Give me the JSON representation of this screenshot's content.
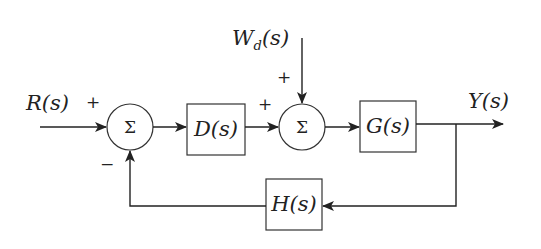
{
  "diagram": {
    "type": "feedback-control-block-diagram",
    "input": {
      "label": "R(s)",
      "sign": "+"
    },
    "disturbance": {
      "label": "W_d(s)",
      "label_main": "W",
      "label_sub": "d",
      "label_tail": "(s)",
      "sign": "+"
    },
    "output": {
      "label": "Y(s)"
    },
    "summing_junctions": [
      {
        "id": "sum1",
        "symbol": "Σ",
        "inputs": [
          {
            "from": "R(s)",
            "sign": "+"
          },
          {
            "from": "H(s)",
            "sign": "−"
          }
        ]
      },
      {
        "id": "sum2",
        "symbol": "Σ",
        "inputs": [
          {
            "from": "D(s)",
            "sign": "+"
          },
          {
            "from": "W_d(s)",
            "sign": "+"
          }
        ]
      }
    ],
    "blocks": [
      {
        "id": "D",
        "label": "D(s)"
      },
      {
        "id": "G",
        "label": "G(s)"
      },
      {
        "id": "H",
        "label": "H(s)"
      }
    ],
    "signs": {
      "r_plus": "+",
      "feedback_minus": "−",
      "d_plus": "+",
      "w_plus": "+"
    },
    "edges": [
      [
        "R(s)",
        "sum1"
      ],
      [
        "sum1",
        "D(s)"
      ],
      [
        "D(s)",
        "sum2"
      ],
      [
        "W_d(s)",
        "sum2"
      ],
      [
        "sum2",
        "G(s)"
      ],
      [
        "G(s)",
        "Y(s)"
      ],
      [
        "Y(s)",
        "H(s)"
      ],
      [
        "H(s)",
        "sum1"
      ]
    ]
  }
}
